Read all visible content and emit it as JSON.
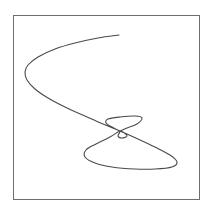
{
  "chart_data": {
    "type": "line",
    "subtype": "parametric-curve",
    "title": "",
    "xlabel": "",
    "ylabel": "",
    "xticks": [],
    "yticks": [],
    "grid": false,
    "legend": null,
    "frame": {
      "x0": 13,
      "y0": 15,
      "x1": 199,
      "y1": 199,
      "color": "#6e6e6e"
    },
    "series": [
      {
        "name": "curve",
        "color": "#4a4a4a",
        "points_px": [
          [
            119,
            35
          ],
          [
            98,
            38
          ],
          [
            75,
            43
          ],
          [
            55,
            49
          ],
          [
            38,
            57
          ],
          [
            28,
            65
          ],
          [
            25,
            72
          ],
          [
            27,
            80
          ],
          [
            35,
            89
          ],
          [
            48,
            98
          ],
          [
            65,
            107
          ],
          [
            85,
            116
          ],
          [
            103,
            124
          ],
          [
            120,
            131
          ],
          [
            138,
            139
          ],
          [
            155,
            147
          ],
          [
            170,
            155
          ],
          [
            177,
            162
          ],
          [
            172,
            167
          ],
          [
            155,
            169
          ],
          [
            135,
            169
          ],
          [
            112,
            167
          ],
          [
            95,
            163
          ],
          [
            85,
            157
          ],
          [
            86,
            150
          ],
          [
            96,
            144
          ],
          [
            110,
            137
          ],
          [
            120,
            131
          ],
          [
            118,
            136
          ],
          [
            122,
            138
          ],
          [
            127,
            136
          ],
          [
            123,
            132
          ],
          [
            120,
            131
          ],
          [
            112,
            127
          ],
          [
            106,
            123
          ],
          [
            108,
            119
          ],
          [
            120,
            117
          ],
          [
            135,
            116
          ],
          [
            142,
            118
          ],
          [
            137,
            124
          ],
          [
            127,
            128
          ],
          [
            120,
            131
          ]
        ]
      }
    ]
  }
}
